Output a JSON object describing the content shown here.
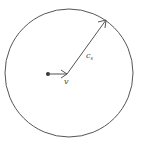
{
  "diagram": {
    "title": "",
    "colors": {
      "stroke": "#555555",
      "background": "#ffffff",
      "text": "#444444"
    },
    "circle": {
      "cx": 69,
      "cy": 73,
      "r": 64
    },
    "source_point": {
      "x": 48,
      "y": 74
    },
    "velocity_arrow": {
      "from": [
        48,
        74
      ],
      "to": [
        67,
        74
      ],
      "label": "v"
    },
    "sound_arrow": {
      "from": [
        67,
        74
      ],
      "to": [
        106,
        20
      ],
      "label": "c",
      "label_subscript": "s"
    }
  }
}
